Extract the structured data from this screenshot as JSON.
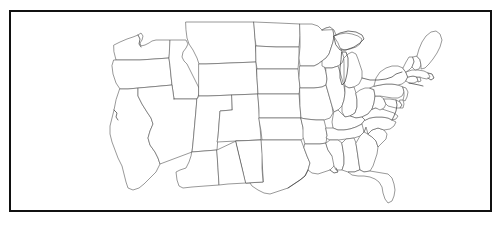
{
  "figure": {
    "kind": "map-figure",
    "title_clipped": "",
    "background_color": "#ffffff",
    "frame": {
      "present": true,
      "color": "#111111",
      "thickness_px": 2.5,
      "x": 9,
      "y": 10,
      "width": 483,
      "height": 202
    }
  },
  "map": {
    "name": "united-states-outline-map",
    "region": "Contiguous United States",
    "projection": "conic",
    "style": "blank outline / unlabeled",
    "fill_color": "#ffffff",
    "state_border_color": "#5a5a5a",
    "coastline_color": "#3c3c3c",
    "labels_visible": false,
    "legend_visible": false,
    "features": [
      "state-boundaries",
      "national-boundary",
      "great-lakes",
      "atlantic-coastline",
      "pacific-coastline",
      "gulf-coastline",
      "florida-peninsula",
      "cape-cod",
      "long-island",
      "chesapeake-bay",
      "puget-sound",
      "texas-gulf-coast"
    ],
    "states_depicted": [
      "Washington",
      "Oregon",
      "California",
      "Nevada",
      "Idaho",
      "Montana",
      "Wyoming",
      "Utah",
      "Arizona",
      "Colorado",
      "New Mexico",
      "North Dakota",
      "South Dakota",
      "Nebraska",
      "Kansas",
      "Oklahoma",
      "Texas",
      "Minnesota",
      "Iowa",
      "Missouri",
      "Arkansas",
      "Louisiana",
      "Wisconsin",
      "Illinois",
      "Michigan",
      "Indiana",
      "Ohio",
      "Kentucky",
      "Tennessee",
      "Mississippi",
      "Alabama",
      "Georgia",
      "Florida",
      "South Carolina",
      "North Carolina",
      "Virginia",
      "West Virginia",
      "Maryland",
      "Delaware",
      "Pennsylvania",
      "New Jersey",
      "New York",
      "Connecticut",
      "Rhode Island",
      "Massachusetts",
      "Vermont",
      "New Hampshire",
      "Maine"
    ],
    "state_count": 48
  }
}
